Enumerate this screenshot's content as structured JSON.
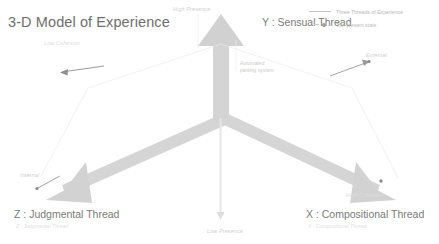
{
  "title": "3-D Model of Experience",
  "axes": {
    "y": {
      "label": "Y : Sensual Thread",
      "positive_tip": "High Presence",
      "negative_tip": "Low Presence"
    },
    "x": {
      "label": "X : Compositional Thread",
      "sub": "X : Compositional Thread",
      "positive_tip": "High Cohesion",
      "side_tip": "External"
    },
    "z": {
      "label": "Z : Judgmental Thread",
      "sub": "Z : Judgmental Thread",
      "positive_tip": "Low Cohesion",
      "side_tip": "Internal"
    }
  },
  "annotation": {
    "line1": "Automated",
    "line2": "parking system"
  },
  "legend": {
    "items": [
      {
        "marker": "line",
        "label": "Three Threads of Experience"
      },
      {
        "marker": "dot",
        "label": "The present state"
      }
    ]
  },
  "colors": {
    "arrow": "#d6d6d6",
    "arrow_edge": "#cfcfcf",
    "guide": "#ededed",
    "text": "#7a7a7a",
    "faint_text": "#cfcfcf"
  }
}
